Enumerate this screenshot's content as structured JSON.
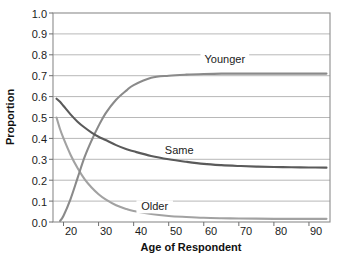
{
  "chart_data": {
    "type": "line",
    "title": "",
    "xlabel": "Age of Respondent",
    "ylabel": "Proportion",
    "xlim": [
      17,
      96
    ],
    "ylim": [
      0.0,
      1.0
    ],
    "grid": true,
    "legend_position": "inline-labels",
    "xticks": [
      20,
      30,
      40,
      50,
      60,
      70,
      80,
      90
    ],
    "xtick_labels": [
      "20",
      "30",
      "40",
      "50",
      "60",
      "70",
      "80",
      "90"
    ],
    "yticks": [
      0.0,
      0.1,
      0.2,
      0.3,
      0.4,
      0.5,
      0.6,
      0.7,
      0.8,
      0.9,
      1.0
    ],
    "ytick_labels": [
      "0.0",
      "0.1",
      "0.2",
      "0.3",
      "0.4",
      "0.5",
      "0.6",
      "0.7",
      "0.8",
      "0.9",
      "1.0"
    ],
    "x": [
      18,
      19,
      20,
      22,
      24,
      26,
      28,
      30,
      32,
      35,
      38,
      40,
      45,
      50,
      55,
      60,
      65,
      70,
      75,
      80,
      85,
      90,
      95
    ],
    "series": [
      {
        "name": "Younger",
        "color": "#8a8a8a",
        "label_x": 66,
        "label_y": 0.78,
        "values": [
          null,
          0.005,
          0.03,
          0.11,
          0.21,
          0.31,
          0.39,
          0.46,
          0.52,
          0.585,
          0.63,
          0.655,
          0.69,
          0.7,
          0.705,
          0.708,
          0.71,
          0.71,
          0.71,
          0.71,
          0.71,
          0.71,
          0.71
        ]
      },
      {
        "name": "Same",
        "color": "#5a5a5a",
        "label_x": 53,
        "label_y": 0.345,
        "values": [
          0.59,
          0.575,
          0.555,
          0.515,
          0.48,
          0.452,
          0.428,
          0.408,
          0.392,
          0.368,
          0.348,
          0.338,
          0.316,
          0.3,
          0.288,
          0.278,
          0.272,
          0.268,
          0.265,
          0.263,
          0.262,
          0.261,
          0.26
        ]
      },
      {
        "name": "Older",
        "color": "#a2a2a2",
        "label_x": 46,
        "label_y": 0.075,
        "values": [
          0.5,
          0.445,
          0.4,
          0.322,
          0.258,
          0.205,
          0.165,
          0.133,
          0.108,
          0.08,
          0.062,
          0.053,
          0.038,
          0.029,
          0.024,
          0.02,
          0.018,
          0.017,
          0.016,
          0.015,
          0.015,
          0.015,
          0.015
        ]
      }
    ]
  },
  "axes": {
    "x_title": "Age of Respondent",
    "y_title": "Proportion"
  },
  "labels": {
    "younger": "Younger",
    "same": "Same",
    "older": "Older"
  },
  "yticks": {
    "t0": "0.0",
    "t1": "0.1",
    "t2": "0.2",
    "t3": "0.3",
    "t4": "0.4",
    "t5": "0.5",
    "t6": "0.6",
    "t7": "0.7",
    "t8": "0.8",
    "t9": "0.9",
    "t10": "1.0"
  },
  "xticks": {
    "t20": "20",
    "t30": "30",
    "t40": "40",
    "t50": "50",
    "t60": "60",
    "t70": "70",
    "t80": "80",
    "t90": "90"
  }
}
